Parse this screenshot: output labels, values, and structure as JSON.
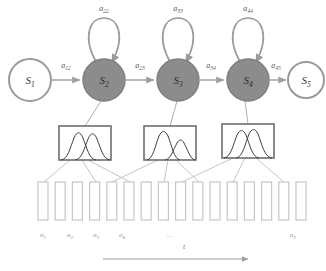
{
  "diagram": {
    "colors": {
      "state_fill_active": "#8c8c8c",
      "state_fill_inactive": "#ffffff",
      "state_stroke": "#9a9a9a",
      "arrow": "#a0a0a0",
      "loop_stroke": "#9a9a9a",
      "box_stroke": "#6e6e6e",
      "curve_stroke": "#3f3f3f",
      "bar_stroke": "#c6c6c6",
      "fan_line": "#bdbdbd",
      "axis": "#9e9e9e",
      "label_text": "#555555",
      "obs_text": "#8d8d8d"
    },
    "states": [
      {
        "id": "s1",
        "label": "S",
        "sub": "1",
        "filled": false,
        "cx": 30,
        "cy": 80,
        "r": 21
      },
      {
        "id": "s2",
        "label": "S",
        "sub": "2",
        "filled": true,
        "cx": 104,
        "cy": 80,
        "r": 21
      },
      {
        "id": "s3",
        "label": "S",
        "sub": "3",
        "filled": true,
        "cx": 178,
        "cy": 80,
        "r": 21
      },
      {
        "id": "s4",
        "label": "S",
        "sub": "4",
        "filled": true,
        "cx": 248,
        "cy": 80,
        "r": 21
      },
      {
        "id": "s5",
        "label": "S",
        "sub": "5",
        "filled": false,
        "cx": 306,
        "cy": 80,
        "r": 18
      }
    ],
    "transitions": [
      {
        "id": "a12",
        "label": "a",
        "sub": "12",
        "from": "s1",
        "to": "s2",
        "x": 66,
        "y": 66
      },
      {
        "id": "a23",
        "label": "a",
        "sub": "23",
        "from": "s2",
        "to": "s3",
        "x": 140,
        "y": 66
      },
      {
        "id": "a34",
        "label": "a",
        "sub": "34",
        "from": "s3",
        "to": "s4",
        "x": 211,
        "y": 66
      },
      {
        "id": "a45",
        "label": "a",
        "sub": "45",
        "from": "s4",
        "to": "s5",
        "x": 276,
        "y": 66
      }
    ],
    "self_loops": [
      {
        "id": "a22",
        "label": "a",
        "sub": "22",
        "state": "s2",
        "x": 104,
        "y": 11
      },
      {
        "id": "a33",
        "label": "a",
        "sub": "33",
        "state": "s3",
        "x": 178,
        "y": 11
      },
      {
        "id": "a44",
        "label": "a",
        "sub": "44",
        "state": "s4",
        "x": 248,
        "y": 11
      }
    ],
    "emission_boxes": [
      {
        "id": "box-s2",
        "state": "s2",
        "x": 59,
        "y": 126,
        "width": 52,
        "height": 34,
        "curves": [
          {
            "mean": 0.33,
            "sigma": 0.15,
            "peak": 0.86
          },
          {
            "mean": 0.7,
            "sigma": 0.13,
            "peak": 0.92
          }
        ]
      },
      {
        "id": "box-s3",
        "state": "s3",
        "x": 144,
        "y": 126,
        "width": 52,
        "height": 34,
        "curves": [
          {
            "mean": 0.3,
            "sigma": 0.13,
            "peak": 0.95
          },
          {
            "mean": 0.66,
            "sigma": 0.14,
            "peak": 0.6
          }
        ]
      },
      {
        "id": "box-s4",
        "state": "s4",
        "x": 222,
        "y": 124,
        "width": 52,
        "height": 34,
        "curves": [
          {
            "mean": 0.38,
            "sigma": 0.16,
            "peak": 0.9
          },
          {
            "mean": 0.58,
            "sigma": 0.14,
            "peak": 0.96
          }
        ]
      }
    ],
    "observations": {
      "count": 16,
      "start_x": 38,
      "pitch": 17.2,
      "bar_width": 10,
      "bar_top": 182,
      "bar_height": 38,
      "labels": [
        {
          "id": "o1",
          "label": "o",
          "sub": "1",
          "x": 43
        },
        {
          "id": "o2",
          "label": "o",
          "sub": "2",
          "x": 70
        },
        {
          "id": "o3",
          "label": "o",
          "sub": "3",
          "x": 96
        },
        {
          "id": "o4",
          "label": "o",
          "sub": "4",
          "x": 122
        },
        {
          "id": "oT",
          "label": "o",
          "sub": "T",
          "x": 293
        }
      ],
      "ellipsis": {
        "text": "...",
        "x": 170,
        "y": 237
      }
    },
    "time_axis": {
      "label": "t",
      "label_x": 184,
      "label_y": 249,
      "x_start": 103,
      "x_end": 248,
      "y": 259
    }
  }
}
